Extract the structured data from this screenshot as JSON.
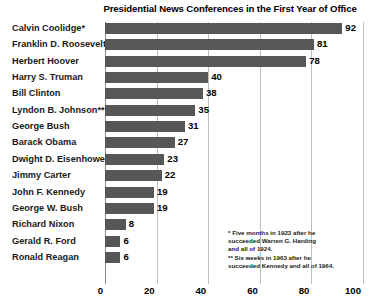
{
  "chart_data": {
    "type": "bar",
    "orientation": "horizontal",
    "title": "Presidential News Conferences in the First Year of Office",
    "xlabel": "",
    "ylabel": "",
    "xlim": [
      0,
      100
    ],
    "xticks": [
      0,
      20,
      40,
      60,
      80,
      100
    ],
    "xtick_labels": [
      "0",
      "20",
      "40",
      "60",
      "80",
      "100"
    ],
    "grid": true,
    "legend": false,
    "bar_color": "#575757",
    "gridline_color": "#bfbfbf",
    "categories": [
      "Calvin Coolidge*",
      "Franklin D. Roosevelt",
      "Herbert Hoover",
      "Harry S. Truman",
      "Bill Clinton",
      "Lyndon B. Johnson**",
      "George Bush",
      "Barack Obama",
      "Dwight D. Eisenhower",
      "Jimmy Carter",
      "John F. Kennedy",
      "George W. Bush",
      "Richard Nixon",
      "Gerald R. Ford",
      "Ronald Reagan"
    ],
    "values": [
      92,
      81,
      78,
      40,
      38,
      35,
      31,
      27,
      23,
      22,
      19,
      19,
      8,
      6,
      6
    ],
    "value_labels": [
      "92",
      "81",
      "78",
      "40",
      "38",
      "35",
      "31",
      "27",
      "23",
      "22",
      "19",
      "19",
      "8",
      "6",
      "6"
    ],
    "annotations": [
      "* Five months in 1923 after he",
      "succeeded Warren G. Harding",
      "and all of 1924.",
      "** Six weeks in 1963 after he",
      "succeeded Kennedy and all of 1964."
    ]
  }
}
